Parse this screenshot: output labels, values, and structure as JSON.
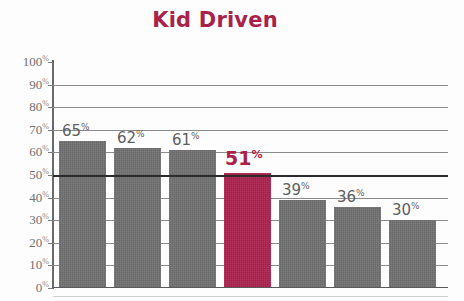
{
  "chart_data": {
    "type": "bar",
    "title": "Kid Driven",
    "xlabel": "",
    "ylabel": "",
    "categories": [
      "",
      "",
      "",
      "",
      "",
      "",
      ""
    ],
    "values": [
      65,
      62,
      61,
      51,
      39,
      36,
      30
    ],
    "value_labels": [
      "65",
      "62",
      "61",
      "51",
      "39",
      "36",
      "30"
    ],
    "percent_symbol": "%",
    "highlight_index": 3,
    "ylim": [
      0,
      100
    ],
    "ytick_step": 10,
    "ytick_labels": [
      "100",
      "90",
      "80",
      "70",
      "60",
      "50",
      "40",
      "30",
      "20",
      "10",
      "0"
    ],
    "ytick_values": [
      100,
      90,
      80,
      70,
      60,
      50,
      40,
      30,
      20,
      10,
      0
    ],
    "emphasis_gridline": 50,
    "grid": true,
    "legend": false,
    "colors": {
      "bar": "#6e6e6e",
      "highlight_bar": "#ab1f4b",
      "title": "#a8234a",
      "axis_text": "#6f6f6f",
      "label_text": "#5e5e5e",
      "gridline": "#8c8c8c",
      "major_gridline": "#2b2b2b",
      "background": "#fdfdfd"
    }
  }
}
